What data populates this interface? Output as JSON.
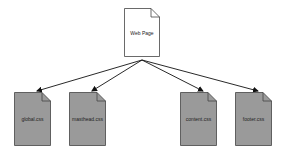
{
  "diagram": {
    "type": "dependency-tree",
    "root": {
      "label": "Web Page",
      "fill": "#ffffff",
      "x": 124,
      "y": 8,
      "w": 36,
      "h": 49
    },
    "children": [
      {
        "label": "global.css",
        "fill": "#9a9a9a",
        "x": 14,
        "y": 92,
        "w": 37,
        "h": 54
      },
      {
        "label": "masthead.css",
        "fill": "#9a9a9a",
        "x": 69,
        "y": 92,
        "w": 37,
        "h": 54
      },
      {
        "label": "content.css",
        "fill": "#9a9a9a",
        "x": 180,
        "y": 92,
        "w": 37,
        "h": 54
      },
      {
        "label": "footer.css",
        "fill": "#9a9a9a",
        "x": 235,
        "y": 92,
        "w": 37,
        "h": 54
      }
    ],
    "edges": [
      {
        "from": "Web Page",
        "to": "global.css"
      },
      {
        "from": "Web Page",
        "to": "masthead.css"
      },
      {
        "from": "Web Page",
        "to": "content.css"
      },
      {
        "from": "Web Page",
        "to": "footer.css"
      }
    ],
    "colors": {
      "stroke": "#444444",
      "arrow": "#111111",
      "child_fill": "#9a9a9a",
      "root_fill": "#ffffff"
    }
  }
}
